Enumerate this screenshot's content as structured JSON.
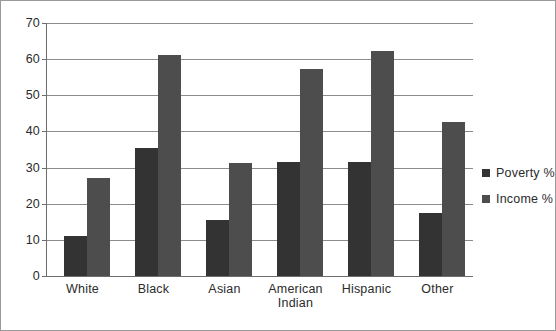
{
  "chart_data": {
    "type": "bar",
    "title": "",
    "xlabel": "",
    "ylabel": "",
    "ylim": [
      0,
      70
    ],
    "ytick_step": 10,
    "yticks": [
      70,
      60,
      50,
      40,
      30,
      20,
      10,
      0
    ],
    "grid": true,
    "legend_position": "right",
    "categories": [
      "White",
      "Black",
      "Asian",
      "American\nIndian",
      "Hispanic",
      "Other"
    ],
    "series": [
      {
        "name": "Poverty %",
        "color": "#333333",
        "values": [
          11.0,
          35.3,
          15.4,
          31.5,
          31.5,
          17.5
        ]
      },
      {
        "name": "Income %",
        "color": "#4d4d4d",
        "values": [
          27.2,
          61.2,
          31.3,
          57.3,
          62.3,
          42.5
        ]
      }
    ]
  },
  "legend": {
    "items": [
      {
        "label": "Poverty %",
        "color": "#333333"
      },
      {
        "label": "Income %",
        "color": "#4d4d4d"
      }
    ]
  },
  "axis": {
    "y_tick_labels": [
      "70",
      "60",
      "50",
      "40",
      "30",
      "20",
      "10",
      "0"
    ]
  },
  "colors": {
    "frame_border": "#9a9a9a",
    "gridline": "#8c8c8c",
    "axis_line": "#6e6e6e",
    "text": "#2b2b2b",
    "background": "#ffffff"
  }
}
